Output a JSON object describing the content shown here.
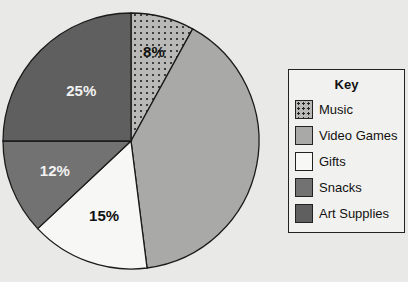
{
  "chart_data": {
    "type": "pie",
    "title": "",
    "categories": [
      "Music",
      "Video Games",
      "Gifts",
      "Snacks",
      "Art Supplies"
    ],
    "values": [
      8,
      40,
      15,
      12,
      25
    ],
    "labels": [
      "8%",
      "",
      "15%",
      "12%",
      "25%"
    ],
    "colors": [
      "#b9b9b7",
      "#a9a9a8",
      "#f7f7f5",
      "#727272",
      "#5f5f5f"
    ],
    "patterns": [
      "dots",
      "solid",
      "solid",
      "solid",
      "solid"
    ],
    "legend_position": "right",
    "legend_title": "Key"
  },
  "legend": {
    "title": "Key",
    "items": [
      {
        "label": "Music",
        "color": "#b9b9b7",
        "pattern": "dots"
      },
      {
        "label": "Video Games",
        "color": "#a9a9a8"
      },
      {
        "label": "Gifts",
        "color": "#f7f7f5"
      },
      {
        "label": "Snacks",
        "color": "#727272"
      },
      {
        "label": "Art Supplies",
        "color": "#5f5f5f"
      }
    ]
  }
}
